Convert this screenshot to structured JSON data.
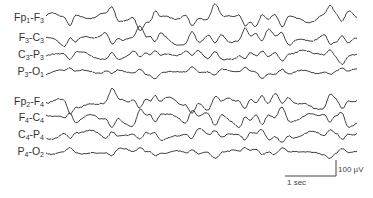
{
  "figure": {
    "type": "EEG bipolar montage tracing",
    "channels": [
      {
        "label_main": "Fp",
        "sub1": "1",
        "mid": "-F",
        "sub2": "3",
        "full": "Fp1-F3",
        "baseline_y": 18
      },
      {
        "label_main": "F",
        "sub1": "3",
        "mid": "-C",
        "sub2": "3",
        "full": "F3-C3",
        "baseline_y": 38
      },
      {
        "label_main": "C",
        "sub1": "3",
        "mid": "-P",
        "sub2": "3",
        "full": "C3-P3",
        "baseline_y": 55
      },
      {
        "label_main": "P",
        "sub1": "3",
        "mid": "-O",
        "sub2": "1",
        "full": "P3-O1",
        "baseline_y": 72
      },
      {
        "label_main": "Fp",
        "sub1": "2",
        "mid": "-F",
        "sub2": "4",
        "full": "Fp2-F4",
        "baseline_y": 102
      },
      {
        "label_main": "F",
        "sub1": "4",
        "mid": "-C",
        "sub2": "4",
        "full": "F4-C4",
        "baseline_y": 118
      },
      {
        "label_main": "C",
        "sub1": "4",
        "mid": "-P",
        "sub2": "4",
        "full": "C4-P4",
        "baseline_y": 135
      },
      {
        "label_main": "P",
        "sub1": "4",
        "mid": "-O",
        "sub2": "2",
        "full": "P4-O2",
        "baseline_y": 152
      }
    ],
    "scale_bar": {
      "time_label": "1 sec",
      "amplitude_label": "100 µV"
    },
    "trace_color": "#444444"
  }
}
